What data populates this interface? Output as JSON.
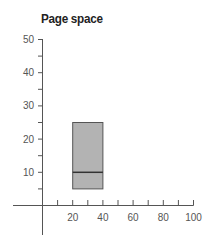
{
  "chart_data": {
    "type": "box",
    "title": "Page space",
    "xlabel": "",
    "ylabel": "",
    "xlim": [
      0,
      100
    ],
    "ylim": [
      0,
      50
    ],
    "x_ticks": [
      20,
      40,
      60,
      80,
      100
    ],
    "x_minor_ticks": [
      10,
      30,
      50,
      70,
      90
    ],
    "y_ticks": [
      10,
      20,
      30,
      40,
      50
    ],
    "y_minor_ticks": [
      5,
      15,
      25,
      35,
      45
    ],
    "grid": false,
    "legend": null,
    "boxes": [
      {
        "x_start": 20,
        "x_end": 40,
        "low": 5,
        "median": 10,
        "high": 25
      }
    ],
    "colors": {
      "box_fill": "#b3b3b3",
      "box_stroke": "#555555",
      "axis": "#555555"
    }
  },
  "labels": {
    "title": "Page space",
    "y_tick_labels": [
      "50",
      "40",
      "30",
      "20",
      "10"
    ],
    "x_tick_labels": [
      "20",
      "40",
      "60",
      "80",
      "100"
    ]
  }
}
